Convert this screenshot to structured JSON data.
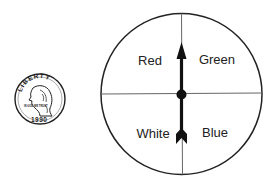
{
  "coin": {
    "top_text": "LIBERTY",
    "year": "1990",
    "motto": "IN GOD WE TRUST"
  },
  "spinner": {
    "sections": [
      {
        "label": "Red",
        "quadrant": "top-left"
      },
      {
        "label": "Green",
        "quadrant": "top-right"
      },
      {
        "label": "White",
        "quadrant": "bottom-left"
      },
      {
        "label": "Blue",
        "quadrant": "bottom-right"
      }
    ],
    "pointer_direction": "up"
  }
}
